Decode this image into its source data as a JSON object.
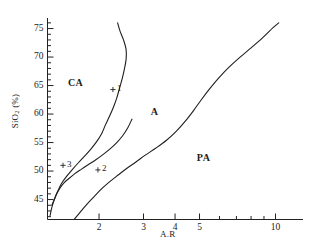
{
  "chart_data": {
    "type": "line",
    "title": "",
    "xlabel": "A.R",
    "ylabel": "SiO2 (%)",
    "ylabel_parts": {
      "pre": "SiO",
      "sub": "2",
      "post": " (%)"
    },
    "xscale": "log",
    "yscale": "linear",
    "xlim": [
      1.25,
      12.5
    ],
    "ylim": [
      41.5,
      76.5
    ],
    "grid": false,
    "legend": null,
    "legend_position": "none",
    "xticks_major": [
      2,
      3,
      4,
      5,
      10
    ],
    "xtick_labels": [
      "2",
      "3",
      "4",
      "5",
      "10"
    ],
    "xticks_minor": [
      6,
      7,
      8,
      9
    ],
    "yticks_major": [
      45,
      50,
      55,
      60,
      65,
      70,
      75
    ],
    "ytick_labels": [
      "45",
      "50",
      "55",
      "60",
      "65",
      "70",
      "75"
    ],
    "ytick_minor_step": 1,
    "field_labels": [
      {
        "text": "CA",
        "x": 1.62,
        "y": 65.2
      },
      {
        "text": "A",
        "x": 3.45,
        "y": 60.2
      },
      {
        "text": "PA",
        "x": 5.25,
        "y": 52.2
      }
    ],
    "data_points": [
      {
        "label": "1",
        "marker": "+",
        "x": 2.27,
        "y": 64.3
      },
      {
        "label": "2",
        "marker": "+",
        "x": 1.98,
        "y": 50.2
      },
      {
        "label": "3",
        "marker": "+",
        "x": 1.44,
        "y": 51.0
      }
    ],
    "boundaries": [
      {
        "name": "CA-A boundary",
        "points": [
          [
            2.37,
            76.0
          ],
          [
            2.42,
            74.6
          ],
          [
            2.5,
            73.0
          ],
          [
            2.56,
            71.3
          ],
          [
            2.56,
            69.6
          ],
          [
            2.52,
            67.9
          ],
          [
            2.47,
            66.2
          ],
          [
            2.41,
            64.5
          ],
          [
            2.35,
            62.8
          ],
          [
            2.28,
            61.2
          ],
          [
            2.2,
            59.6
          ],
          [
            2.12,
            58.1
          ],
          [
            2.05,
            56.6
          ],
          [
            1.96,
            55.2
          ],
          [
            1.86,
            53.9
          ],
          [
            1.76,
            52.7
          ],
          [
            1.66,
            51.5
          ],
          [
            1.57,
            50.3
          ],
          [
            1.49,
            49.1
          ],
          [
            1.42,
            47.8
          ],
          [
            1.37,
            46.4
          ],
          [
            1.33,
            45.0
          ],
          [
            1.3,
            43.6
          ],
          [
            1.28,
            42.2
          ]
        ]
      },
      {
        "name": "A-PA boundary",
        "points": [
          [
            1.6,
            41.6
          ],
          [
            1.7,
            43.0
          ],
          [
            1.8,
            44.3
          ],
          [
            1.92,
            45.6
          ],
          [
            2.05,
            46.9
          ],
          [
            2.2,
            48.1
          ],
          [
            2.38,
            49.3
          ],
          [
            2.58,
            50.5
          ],
          [
            2.8,
            51.6
          ],
          [
            3.05,
            52.8
          ],
          [
            3.35,
            54.0
          ],
          [
            3.7,
            55.4
          ],
          [
            4.05,
            57.0
          ],
          [
            4.4,
            58.8
          ],
          [
            4.75,
            60.7
          ],
          [
            5.1,
            62.6
          ],
          [
            5.5,
            64.5
          ],
          [
            5.95,
            66.3
          ],
          [
            6.5,
            68.1
          ],
          [
            7.2,
            69.9
          ],
          [
            8.0,
            71.6
          ],
          [
            8.9,
            73.4
          ],
          [
            9.8,
            75.2
          ],
          [
            10.3,
            76.0
          ]
        ]
      },
      {
        "name": "left boundary",
        "points": [
          [
            1.3,
            44.0
          ],
          [
            1.33,
            45.0
          ],
          [
            1.36,
            46.0
          ],
          [
            1.4,
            47.0
          ],
          [
            1.45,
            47.9
          ],
          [
            1.52,
            48.7
          ],
          [
            1.6,
            49.5
          ],
          [
            1.7,
            50.3
          ],
          [
            1.81,
            51.1
          ],
          [
            1.93,
            51.9
          ],
          [
            2.06,
            52.8
          ],
          [
            2.2,
            53.8
          ],
          [
            2.34,
            54.9
          ],
          [
            2.48,
            56.2
          ],
          [
            2.6,
            57.6
          ],
          [
            2.7,
            59.1
          ]
        ]
      }
    ]
  },
  "axes": {
    "y_axis_name": "silica-axis",
    "x_axis_name": "alkalinity-ratio-axis"
  }
}
